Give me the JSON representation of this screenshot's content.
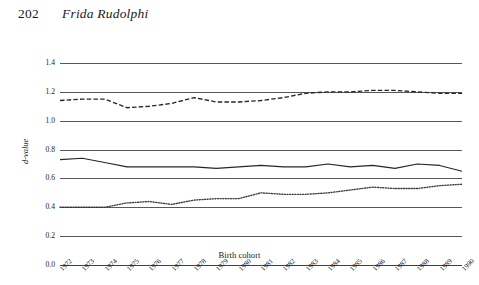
{
  "page": {
    "folio": "202",
    "author": "Frida Rudolphi"
  },
  "chart_data": {
    "type": "line",
    "title": "",
    "xlabel": "Birth cohort",
    "ylabel": "d-value",
    "xlim": [
      1972,
      1990
    ],
    "ylim": [
      0.0,
      1.4
    ],
    "ytick_labels": [
      "0.0",
      "0.2",
      "0.4",
      "0.6",
      "0.8",
      "1.0",
      "1.2",
      "1.4"
    ],
    "ytick_values": [
      0.0,
      0.2,
      0.4,
      0.6,
      0.8,
      1.0,
      1.2,
      1.4
    ],
    "grid": true,
    "legend": "none",
    "x": [
      1972,
      1973,
      1974,
      1975,
      1976,
      1977,
      1978,
      1979,
      1980,
      1981,
      1982,
      1983,
      1984,
      1985,
      1986,
      1987,
      1988,
      1989,
      1990
    ],
    "series": [
      {
        "name": "upper-dashed-series",
        "style": "dashed",
        "color": "#262626",
        "values": [
          1.14,
          1.15,
          1.15,
          1.09,
          1.1,
          1.12,
          1.16,
          1.13,
          1.13,
          1.14,
          1.16,
          1.19,
          1.2,
          1.2,
          1.21,
          1.21,
          1.2,
          1.19,
          1.19
        ]
      },
      {
        "name": "middle-solid-series",
        "style": "solid",
        "color": "#262626",
        "values": [
          0.73,
          0.74,
          0.71,
          0.68,
          0.68,
          0.68,
          0.68,
          0.67,
          0.68,
          0.69,
          0.68,
          0.68,
          0.7,
          0.68,
          0.69,
          0.67,
          0.7,
          0.69,
          0.65
        ]
      },
      {
        "name": "lower-dotted-series",
        "style": "dotted",
        "color": "#3a3a3a",
        "values": [
          0.4,
          0.4,
          0.4,
          0.43,
          0.44,
          0.42,
          0.45,
          0.46,
          0.46,
          0.5,
          0.49,
          0.49,
          0.5,
          0.52,
          0.54,
          0.53,
          0.53,
          0.55,
          0.56
        ]
      }
    ]
  }
}
